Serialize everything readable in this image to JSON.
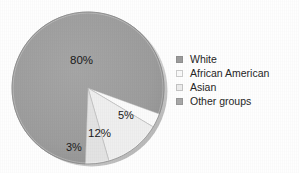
{
  "chart_data": {
    "type": "pie",
    "title": "",
    "labels": [
      "White",
      "African American",
      "Asian",
      "Other groups"
    ],
    "values": [
      80,
      3,
      12,
      5
    ],
    "value_labels": [
      "80%",
      "3%",
      "12%",
      "5%"
    ],
    "colors": [
      "#9d9d9d",
      "#fbfbfb",
      "#eeeeee",
      "#e2e2e2"
    ],
    "legend_position": "right",
    "grid": false,
    "xlabel": "",
    "ylabel": ""
  },
  "pie": {
    "slices": [
      {
        "name": "White",
        "percent_label": "80%",
        "value": 80,
        "color": "#9d9d9d"
      },
      {
        "name": "African American",
        "percent_label": "3%",
        "value": 3,
        "color": "#fbfbfb"
      },
      {
        "name": "Asian",
        "percent_label": "12%",
        "value": 12,
        "color": "#eeeeee"
      },
      {
        "name": "Other groups",
        "percent_label": "5%",
        "value": 5,
        "color": "#e2e2e2"
      }
    ]
  },
  "legend": {
    "items": [
      {
        "label": "White",
        "swatch": "#9d9d9d"
      },
      {
        "label": "African American",
        "swatch": "#fafafa"
      },
      {
        "label": "Asian",
        "swatch": "#ededed"
      },
      {
        "label": "Other groups",
        "swatch": "#a8a8a8"
      }
    ]
  }
}
